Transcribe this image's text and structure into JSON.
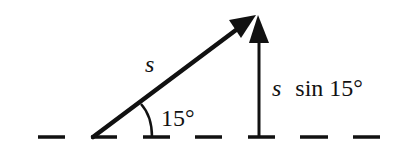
{
  "diagram": {
    "vector_label": "s",
    "angle_label": "15°",
    "component_label_var": "s",
    "component_label_rest": "sin 15°",
    "angle_degrees": 15,
    "colors": {
      "ink": "#111111",
      "background": "#ffffff"
    }
  }
}
